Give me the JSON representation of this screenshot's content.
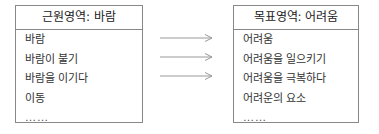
{
  "source_domain": {
    "title": "근원영역: 바람",
    "items": [
      "바람",
      "바람이 불기",
      "바람을 이기다",
      "이동",
      "……"
    ]
  },
  "target_domain": {
    "title": "목표영역: 어려움",
    "items": [
      "어려움",
      "어려움을 일으키기",
      "어려움을 극복하다",
      "어려운의 요소",
      "……"
    ]
  },
  "mappings": [
    {
      "from": 0,
      "to": 0
    },
    {
      "from": 1,
      "to": 1
    },
    {
      "from": 2,
      "to": 2
    }
  ],
  "colors": {
    "border": "#888888",
    "arrow": "#999999",
    "text": "#333333"
  }
}
